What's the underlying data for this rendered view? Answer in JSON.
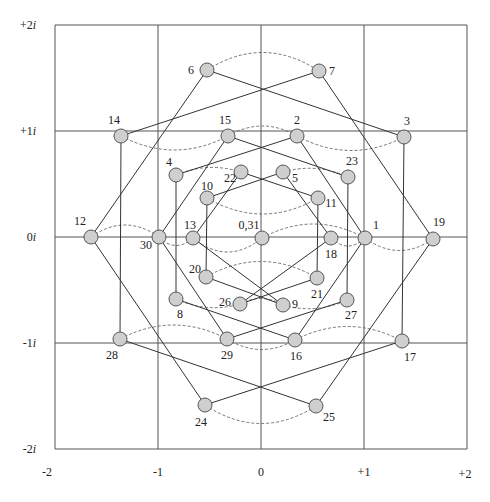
{
  "figure": {
    "title": "",
    "grid": {
      "x_lines": [
        55,
        158,
        261,
        364,
        467
      ],
      "y_lines": [
        25,
        131,
        237,
        343,
        449
      ],
      "x_ticks": [
        {
          "label": "-2",
          "x": 47,
          "y": 476
        },
        {
          "label": "-1",
          "x": 158,
          "y": 476
        },
        {
          "label": "0",
          "x": 261,
          "y": 476
        },
        {
          "label": "+1",
          "x": 364,
          "y": 476
        },
        {
          "label": "+2",
          "x": 465,
          "y": 478
        }
      ],
      "y_ticks": [
        {
          "label": "+2i",
          "x": 36,
          "y": 29
        },
        {
          "label": "+1i",
          "x": 36,
          "y": 135
        },
        {
          "label": "0i",
          "x": 36,
          "y": 241
        },
        {
          "label": "-1i",
          "x": 36,
          "y": 347
        },
        {
          "label": "-2i",
          "x": 36,
          "y": 453
        }
      ]
    },
    "node_radius": 7,
    "nodes": [
      {
        "id": "6",
        "x": 207,
        "y": 70,
        "lx": 194,
        "ly": 74,
        "anchor": "end"
      },
      {
        "id": "7",
        "x": 319,
        "y": 71,
        "lx": 329,
        "ly": 75,
        "anchor": "start"
      },
      {
        "id": "14",
        "x": 121,
        "y": 136,
        "lx": 114,
        "ly": 124,
        "anchor": "middle"
      },
      {
        "id": "15",
        "x": 228,
        "y": 136,
        "lx": 225,
        "ly": 124,
        "anchor": "middle"
      },
      {
        "id": "2",
        "x": 297,
        "y": 136,
        "lx": 297,
        "ly": 124,
        "anchor": "middle"
      },
      {
        "id": "3",
        "x": 404,
        "y": 137,
        "lx": 407,
        "ly": 125,
        "anchor": "middle"
      },
      {
        "id": "4",
        "x": 176,
        "y": 175,
        "lx": 169,
        "ly": 166,
        "anchor": "middle"
      },
      {
        "id": "22",
        "x": 241,
        "y": 172,
        "lx": 230,
        "ly": 182,
        "anchor": "middle"
      },
      {
        "id": "5",
        "x": 283,
        "y": 172,
        "lx": 295,
        "ly": 182,
        "anchor": "middle"
      },
      {
        "id": "23",
        "x": 348,
        "y": 177,
        "lx": 352,
        "ly": 165,
        "anchor": "middle"
      },
      {
        "id": "10",
        "x": 207,
        "y": 198,
        "lx": 207,
        "ly": 190,
        "anchor": "middle"
      },
      {
        "id": "11",
        "x": 318,
        "y": 198,
        "lx": 331,
        "ly": 207,
        "anchor": "middle"
      },
      {
        "id": "12",
        "x": 91,
        "y": 237,
        "lx": 80,
        "ly": 225,
        "anchor": "middle"
      },
      {
        "id": "30",
        "x": 159,
        "y": 237,
        "lx": 146,
        "ly": 249,
        "anchor": "middle"
      },
      {
        "id": "13",
        "x": 193,
        "y": 238,
        "lx": 190,
        "ly": 229,
        "anchor": "middle"
      },
      {
        "id": "0,31",
        "x": 262,
        "y": 238,
        "lx": 249,
        "ly": 229,
        "anchor": "middle"
      },
      {
        "id": "18",
        "x": 331,
        "y": 238,
        "lx": 331,
        "ly": 258,
        "anchor": "middle"
      },
      {
        "id": "1",
        "x": 365,
        "y": 238,
        "lx": 373,
        "ly": 229,
        "anchor": "start"
      },
      {
        "id": "19",
        "x": 433,
        "y": 239,
        "lx": 439,
        "ly": 226,
        "anchor": "middle"
      },
      {
        "id": "20",
        "x": 206,
        "y": 277,
        "lx": 195,
        "ly": 273,
        "anchor": "middle"
      },
      {
        "id": "21",
        "x": 317,
        "y": 278,
        "lx": 317,
        "ly": 298,
        "anchor": "middle"
      },
      {
        "id": "8",
        "x": 176,
        "y": 299,
        "lx": 180,
        "ly": 318,
        "anchor": "middle"
      },
      {
        "id": "26",
        "x": 240,
        "y": 304,
        "lx": 225,
        "ly": 306,
        "anchor": "middle"
      },
      {
        "id": "9",
        "x": 283,
        "y": 305,
        "lx": 295,
        "ly": 308,
        "anchor": "middle"
      },
      {
        "id": "27",
        "x": 347,
        "y": 300,
        "lx": 351,
        "ly": 319,
        "anchor": "middle"
      },
      {
        "id": "28",
        "x": 120,
        "y": 339,
        "lx": 112,
        "ly": 359,
        "anchor": "middle"
      },
      {
        "id": "29",
        "x": 227,
        "y": 339,
        "lx": 227,
        "ly": 359,
        "anchor": "middle"
      },
      {
        "id": "16",
        "x": 295,
        "y": 340,
        "lx": 296,
        "ly": 360,
        "anchor": "middle"
      },
      {
        "id": "17",
        "x": 402,
        "y": 341,
        "lx": 410,
        "ly": 361,
        "anchor": "middle"
      },
      {
        "id": "24",
        "x": 205,
        "y": 405,
        "lx": 201,
        "ly": 426,
        "anchor": "middle"
      },
      {
        "id": "25",
        "x": 316,
        "y": 406,
        "lx": 329,
        "ly": 421,
        "anchor": "middle"
      }
    ],
    "edges": [
      [
        "6",
        "3"
      ],
      [
        "7",
        "14"
      ],
      [
        "6",
        "12"
      ],
      [
        "7",
        "19"
      ],
      [
        "14",
        "28"
      ],
      [
        "3",
        "17"
      ],
      [
        "12",
        "24"
      ],
      [
        "19",
        "25"
      ],
      [
        "28",
        "25"
      ],
      [
        "17",
        "24"
      ],
      [
        "15",
        "23"
      ],
      [
        "2",
        "4"
      ],
      [
        "15",
        "30"
      ],
      [
        "2",
        "1"
      ],
      [
        "4",
        "8"
      ],
      [
        "23",
        "27"
      ],
      [
        "30",
        "29"
      ],
      [
        "1",
        "16"
      ],
      [
        "8",
        "16"
      ],
      [
        "27",
        "29"
      ],
      [
        "22",
        "11"
      ],
      [
        "5",
        "10"
      ],
      [
        "22",
        "13"
      ],
      [
        "5",
        "18"
      ],
      [
        "10",
        "20"
      ],
      [
        "11",
        "21"
      ],
      [
        "13",
        "9"
      ],
      [
        "18",
        "26"
      ],
      [
        "20",
        "9"
      ],
      [
        "21",
        "26"
      ]
    ],
    "dashed_arcs": [
      {
        "from": "6",
        "to": "7",
        "bulge": -18
      },
      {
        "from": "14",
        "to": "15",
        "bulge": 14
      },
      {
        "from": "2",
        "to": "3",
        "bulge": 14
      },
      {
        "from": "4",
        "to": "22",
        "bulge": -6
      },
      {
        "from": "5",
        "to": "23",
        "bulge": -6
      },
      {
        "from": "15",
        "to": "2",
        "bulge": -10
      },
      {
        "from": "10",
        "to": "11",
        "bulge": 16
      },
      {
        "from": "12",
        "to": "30",
        "bulge": -12
      },
      {
        "from": "30",
        "to": "13",
        "bulge": 8
      },
      {
        "from": "13",
        "to": "0,31",
        "bulge": 14
      },
      {
        "from": "0,31",
        "to": "1",
        "bulge": -14
      },
      {
        "from": "18",
        "to": "1",
        "bulge": 8
      },
      {
        "from": "1",
        "to": "19",
        "bulge": 12
      },
      {
        "from": "20",
        "to": "21",
        "bulge": -16
      },
      {
        "from": "8",
        "to": "26",
        "bulge": 6
      },
      {
        "from": "9",
        "to": "27",
        "bulge": 6
      },
      {
        "from": "26",
        "to": "9",
        "bulge": -6
      },
      {
        "from": "28",
        "to": "29",
        "bulge": -14
      },
      {
        "from": "16",
        "to": "17",
        "bulge": -14
      },
      {
        "from": "29",
        "to": "16",
        "bulge": 10
      },
      {
        "from": "24",
        "to": "25",
        "bulge": 18
      }
    ]
  }
}
